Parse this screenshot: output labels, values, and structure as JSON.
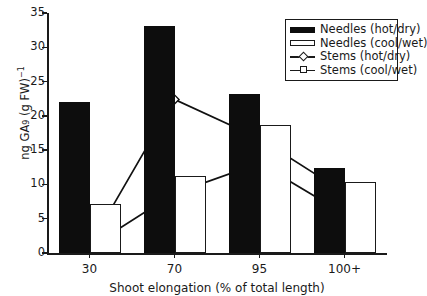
{
  "chart_data": {
    "type": "bar",
    "title": "",
    "xlabel": "Shoot elongation (% of total length)",
    "ylabel_parts": {
      "prefix": "ng GA",
      "sub": "9",
      "mid": " (g FW)",
      "sup": "-1"
    },
    "ylabel": "ng GA9 (g FW)-1",
    "categories": [
      "30",
      "70",
      "95",
      "100+"
    ],
    "ylim": [
      0,
      35
    ],
    "yticks": [
      0,
      5,
      10,
      15,
      20,
      25,
      30,
      35
    ],
    "grid": false,
    "legend_position": "top-right",
    "series": [
      {
        "name": "Needles (hot/dry)",
        "type": "bar",
        "style": "filled",
        "values": [
          22.0,
          33.1,
          23.2,
          12.4
        ]
      },
      {
        "name": "Needles (cool/wet)",
        "type": "bar",
        "style": "open",
        "values": [
          7.1,
          11.2,
          18.7,
          10.3
        ]
      },
      {
        "name": "Stems (hot/dry)",
        "type": "line",
        "marker": "diamond",
        "values": [
          1.0,
          22.4,
          16.7,
          8.8
        ]
      },
      {
        "name": "Stems (cool/wet)",
        "type": "line",
        "marker": "square",
        "values": [
          0.8,
          8.7,
          13.1,
          5.7
        ]
      }
    ]
  },
  "legend": {
    "entries": [
      {
        "label": "Needles (hot/dry)",
        "key": "filled-swatch"
      },
      {
        "label": "Needles (cool/wet)",
        "key": "open-swatch"
      },
      {
        "label": "Stems (hot/dry)",
        "key": "line-diamond"
      },
      {
        "label": "Stems (cool/wet)",
        "key": "line-square"
      }
    ]
  }
}
